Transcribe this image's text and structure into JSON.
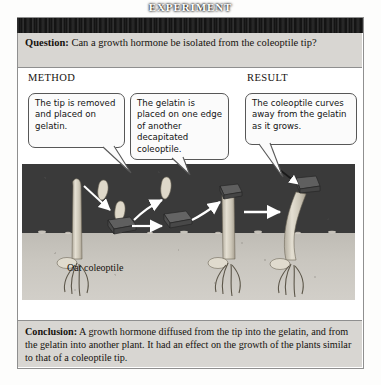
{
  "header": {
    "title": "EXPERIMENT"
  },
  "question": {
    "label": "Question:",
    "text": " Can a growth hormone be isolated from the coleoptile tip?"
  },
  "sections": {
    "method_label": "METHOD",
    "result_label": "RESULT"
  },
  "callouts": [
    {
      "id": "method-step-1",
      "text": "The tip is removed and placed on gelatin."
    },
    {
      "id": "method-step-2",
      "text": "The gelatin is placed on one edge of another decapitated coleoptile."
    },
    {
      "id": "result-observation",
      "text": "The coleoptile curves away from the gelatin as it grows."
    }
  ],
  "illustration": {
    "caption": "Oat coleoptile",
    "colors": {
      "air": "#3a3a3a",
      "soil": "#c9c6bf",
      "plant": "#d9d4c8",
      "gelatin_block": "#5a5a5a",
      "arrow": "#ffffff"
    },
    "elements": [
      {
        "name": "intact-coleoptile",
        "description": "whole oat coleoptile with pointed tip"
      },
      {
        "name": "severed-tip",
        "description": "removed coleoptile tip"
      },
      {
        "name": "gelatin-block-with-tip",
        "description": "tip resting on gelatin block"
      },
      {
        "name": "gelatin-block-transferred",
        "description": "gelatin block moved to new plant"
      },
      {
        "name": "decapitated-coleoptile",
        "description": "coleoptile with tip removed"
      },
      {
        "name": "curved-coleoptile",
        "description": "coleoptile bending away from gelatin"
      }
    ]
  },
  "conclusion": {
    "label": "Conclusion:",
    "text": " A growth hormone diffused from the tip into the gelatin, and from the gelatin into another plant. It had an effect on the growth of the plants similar to that of a coleoptile tip."
  }
}
